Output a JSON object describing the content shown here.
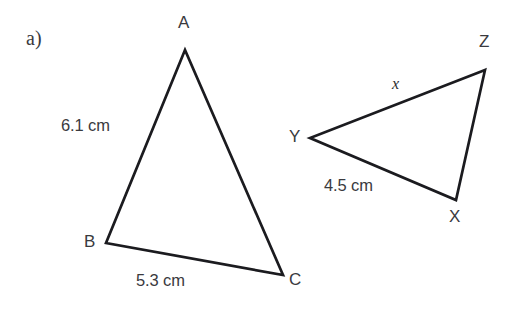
{
  "figure": {
    "item_label": "a)",
    "stroke_color": "#1b1b1f",
    "text_color": "#3a3a3e",
    "background_color": "#ffffff"
  },
  "triangle_abc": {
    "name": "ABC",
    "vertices": [
      {
        "name": "A",
        "label": "A",
        "x": 185,
        "y": 50
      },
      {
        "name": "B",
        "label": "B",
        "x": 106,
        "y": 243
      },
      {
        "name": "C",
        "label": "C",
        "x": 283,
        "y": 275
      }
    ],
    "sides": [
      {
        "name": "AB",
        "label": "6.1 cm",
        "value": 6.1,
        "unit": "cm"
      },
      {
        "name": "BC",
        "label": "5.3 cm",
        "value": 5.3,
        "unit": "cm"
      }
    ]
  },
  "triangle_xyz": {
    "name": "XYZ",
    "vertices": [
      {
        "name": "Z",
        "label": "Z",
        "x": 485,
        "y": 70
      },
      {
        "name": "Y",
        "label": "Y",
        "x": 310,
        "y": 138
      },
      {
        "name": "X",
        "label": "X",
        "x": 456,
        "y": 200
      }
    ],
    "sides": [
      {
        "name": "YZ",
        "label": "x",
        "value": null,
        "unit": ""
      },
      {
        "name": "YX",
        "label": "4.5 cm",
        "value": 4.5,
        "unit": "cm"
      }
    ]
  }
}
